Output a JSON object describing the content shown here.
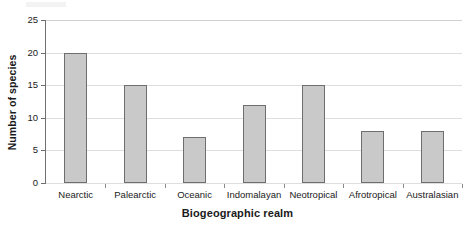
{
  "chart_data": {
    "type": "bar",
    "title": "",
    "xlabel": "Biogeographic realm",
    "ylabel": "Number of species",
    "categories": [
      "Nearctic",
      "Palearctic",
      "Oceanic",
      "Indomalayan",
      "Neotropical",
      "Afrotropical",
      "Australasian"
    ],
    "values": [
      20,
      15,
      7,
      12,
      15,
      8,
      8
    ],
    "ylim": [
      0,
      25
    ],
    "ytick_labels": [
      "0",
      "5",
      "10",
      "15",
      "20",
      "25"
    ],
    "ytick_values": [
      0,
      5,
      10,
      15,
      20,
      25
    ],
    "grid": true,
    "grid_axis": "y",
    "legend": false,
    "legend_position": "none",
    "colors": {
      "bar_fill": "#c9c9c9",
      "bar_border": "#6e6e6e",
      "gridline": "#dedede",
      "axis_line": "#6f6f6f",
      "text": "#1a1a1a",
      "background": "#ffffff"
    }
  }
}
